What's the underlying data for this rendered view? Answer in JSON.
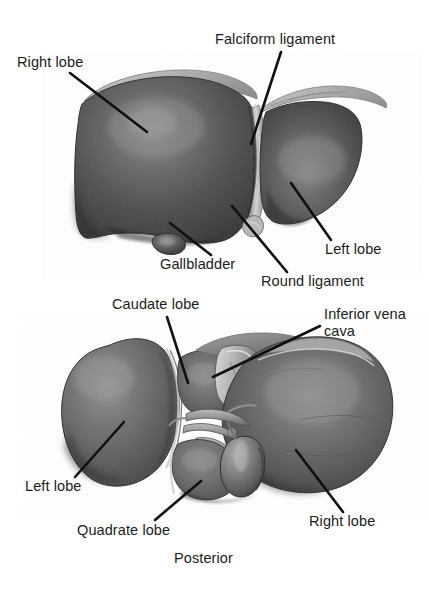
{
  "figure": {
    "background_color": "#ffffff",
    "ink_color": "#1b1b1b",
    "tissue_colors": {
      "liver_dark": "#3e3e3e",
      "liver_mid": "#5d5d5d",
      "liver_light": "#7d7d7d",
      "highlight": "#9a9a9a",
      "ligament_pale": "#c9c9c9",
      "vessel_pale": "#b4b4b4",
      "outline": "#2a2a2a"
    }
  },
  "views": [
    {
      "name": "anterior-view",
      "caption": "",
      "labels": [
        {
          "key": "right_lobe",
          "text": "Right lobe"
        },
        {
          "key": "falciform_ligament",
          "text": "Falciform ligament"
        },
        {
          "key": "left_lobe",
          "text": "Left lobe"
        },
        {
          "key": "gallbladder",
          "text": "Gallbladder"
        },
        {
          "key": "round_ligament",
          "text": "Round ligament"
        }
      ]
    },
    {
      "name": "posterior-view",
      "caption": "Posterior",
      "labels": [
        {
          "key": "caudate_lobe",
          "text": "Caudate lobe"
        },
        {
          "key": "inferior_vena_cava",
          "text": "Inferior vena\ncava"
        },
        {
          "key": "left_lobe",
          "text": "Left lobe"
        },
        {
          "key": "quadrate_lobe",
          "text": "Quadrate lobe"
        },
        {
          "key": "right_lobe",
          "text": "Right lobe"
        }
      ]
    }
  ],
  "anterior": {
    "right_lobe": "Right lobe",
    "falciform_ligament": "Falciform ligament",
    "left_lobe": "Left lobe",
    "gallbladder": "Gallbladder",
    "round_ligament": "Round ligament"
  },
  "posterior": {
    "caudate_lobe": "Caudate lobe",
    "inferior_vena_cava_line1": "Inferior vena",
    "inferior_vena_cava_line2": "cava",
    "left_lobe": "Left lobe",
    "quadrate_lobe": "Quadrate lobe",
    "right_lobe": "Right lobe",
    "orientation": "Posterior"
  }
}
